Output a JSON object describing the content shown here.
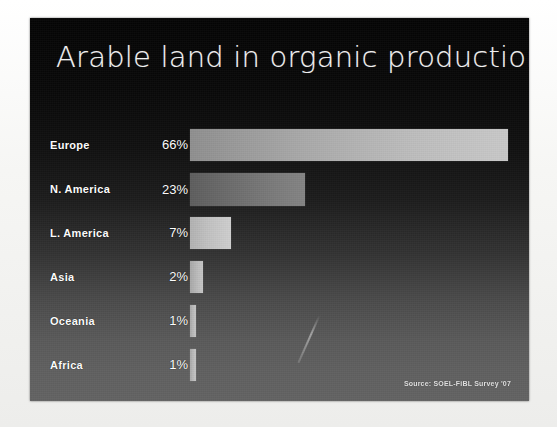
{
  "slide": {
    "title": "Arable land in organic production",
    "source_credit": "Source: SOEL-FiBL Survey '07",
    "background_color": "#0a0a0a",
    "title_color": "#f4f4f4"
  },
  "chart_data": {
    "type": "bar",
    "orientation": "horizontal",
    "title": "Arable land in organic production",
    "xlabel": "",
    "ylabel": "",
    "categories": [
      "Europe",
      "N. America",
      "L. America",
      "Asia",
      "Oceania",
      "Africa"
    ],
    "values": [
      66,
      23,
      7,
      2,
      1,
      1
    ],
    "value_labels": [
      "66%",
      "23%",
      "7%",
      "2%",
      "1%",
      "1%"
    ],
    "units": "percent",
    "xlim": [
      0,
      70
    ],
    "grid": false,
    "legend": null,
    "annotations": [
      "Source: SOEL-FiBL Survey '07"
    ],
    "bars": [
      {
        "category": "Europe",
        "value": 66,
        "label": "66%",
        "width_px": 318,
        "top_px": 111,
        "height_px": 32,
        "shade": "normal"
      },
      {
        "category": "N. America",
        "value": 23,
        "label": "23%",
        "width_px": 115,
        "top_px": 155,
        "height_px": 33,
        "shade": "dim"
      },
      {
        "category": "L. America",
        "value": 7,
        "label": "7%",
        "width_px": 41,
        "top_px": 199,
        "height_px": 32,
        "shade": "bright"
      },
      {
        "category": "Asia",
        "value": 2,
        "label": "2%",
        "width_px": 13,
        "top_px": 243,
        "height_px": 32,
        "shade": "sliver"
      },
      {
        "category": "Oceania",
        "value": 1,
        "label": "1%",
        "width_px": 6,
        "top_px": 287,
        "height_px": 32,
        "shade": "sliver"
      },
      {
        "category": "Africa",
        "value": 1,
        "label": "1%",
        "width_px": 6,
        "top_px": 331,
        "height_px": 32,
        "shade": "sliver"
      }
    ]
  }
}
